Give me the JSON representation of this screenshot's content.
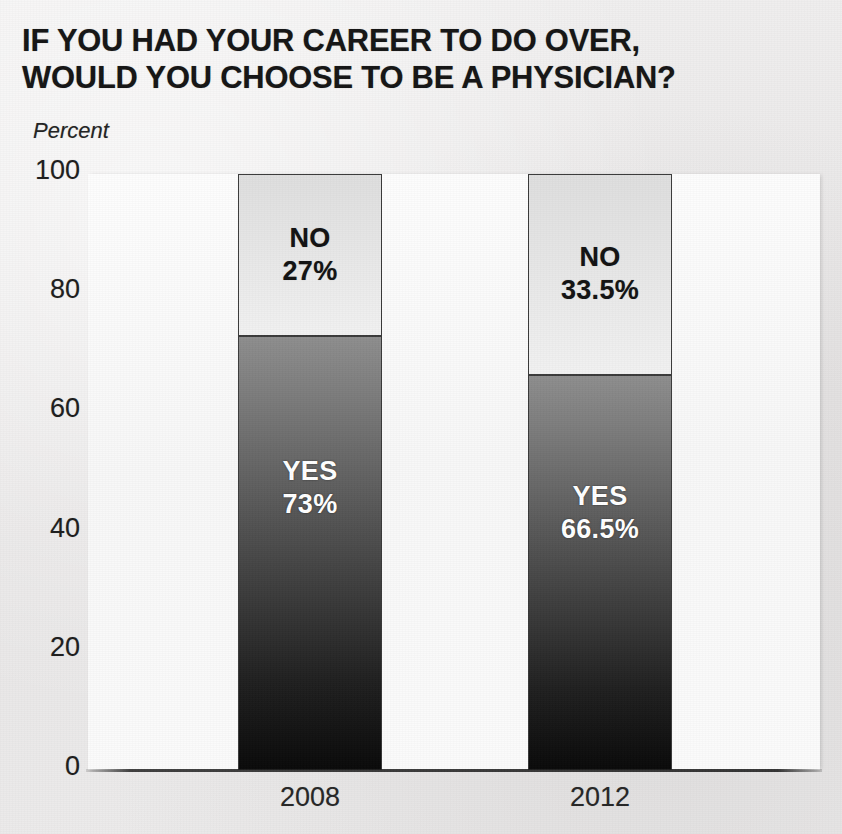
{
  "chart_data": {
    "type": "bar",
    "subtype": "stacked-bar-100",
    "title": "IF YOU HAD YOUR CAREER TO DO OVER, WOULD YOU CHOOSE TO BE A PHYSICIAN?",
    "title_lines": [
      "IF YOU HAD YOUR CAREER TO DO OVER,",
      "WOULD YOU CHOOSE TO BE A PHYSICIAN?"
    ],
    "xlabel": "",
    "ylabel": "Percent",
    "ylim": [
      0,
      100
    ],
    "yticks": [
      0,
      20,
      40,
      60,
      80,
      100
    ],
    "ytick_labels": [
      "0",
      "20",
      "40",
      "60",
      "80",
      "100"
    ],
    "grid": false,
    "legend": "none (in-bar labels)",
    "categories": [
      "2008",
      "2012"
    ],
    "series": [
      {
        "name": "YES",
        "values": [
          73,
          66.5
        ],
        "value_labels": [
          "73%",
          "66.5%"
        ],
        "color": "#4a4a4a",
        "gradient_top": "#8d8d8d",
        "gradient_bottom": "#090909",
        "label_color": "#ffffff"
      },
      {
        "name": "NO",
        "values": [
          27,
          33.5
        ],
        "value_labels": [
          "27%",
          "33.5%"
        ],
        "color": "#e3e3e3",
        "gradient_top": "#dedede",
        "gradient_bottom": "#f1f1f1",
        "label_color": "#121212"
      }
    ],
    "bars": [
      {
        "category": "2008",
        "segments": [
          {
            "name": "NO",
            "label": "NO",
            "value": 27,
            "value_label": "27%"
          },
          {
            "name": "YES",
            "label": "YES",
            "value": 73,
            "value_label": "73%"
          }
        ]
      },
      {
        "category": "2012",
        "segments": [
          {
            "name": "NO",
            "label": "NO",
            "value": 33.5,
            "value_label": "33.5%"
          },
          {
            "name": "YES",
            "label": "YES",
            "value": 66.5,
            "value_label": "66.5%"
          }
        ]
      }
    ],
    "colors": {
      "page_background": "#eceaea",
      "plot_background": "#fbfbfb",
      "axis_line": "#232323",
      "bar_outline": "#3a3a3a",
      "title_text": "#151515",
      "tick_text": "#1d1d1d"
    }
  },
  "title": {
    "line1": "IF YOU HAD YOUR CAREER TO DO OVER,",
    "line2": "WOULD YOU CHOOSE TO BE A PHYSICIAN?"
  },
  "axes": {
    "unit_label": "Percent",
    "y_ticks": [
      "100",
      "80",
      "60",
      "40",
      "20",
      "0"
    ],
    "x_labels": [
      "2008",
      "2012"
    ]
  },
  "bar_2008": {
    "no_label": "NO",
    "no_value": "27%",
    "yes_label": "YES",
    "yes_value": "73%",
    "year": "2008"
  },
  "bar_2012": {
    "no_label": "NO",
    "no_value": "33.5%",
    "yes_label": "YES",
    "yes_value": "66.5%",
    "year": "2012"
  }
}
